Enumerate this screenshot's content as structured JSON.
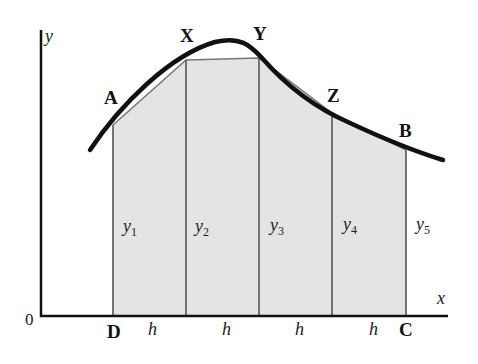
{
  "figure": {
    "type": "trapezium-rule-diagram",
    "colors": {
      "shade": "#e4e4e4",
      "curve": "#111111",
      "axis": "#111111",
      "ordinate": "#555555"
    }
  },
  "axes": {
    "x_label": "x",
    "y_label": "y",
    "origin_label": "0"
  },
  "points": {
    "A": "A",
    "X": "X",
    "Y": "Y",
    "Z": "Z",
    "B": "B",
    "D": "D",
    "C": "C"
  },
  "ordinates": [
    {
      "name": "y",
      "sub": "1"
    },
    {
      "name": "y",
      "sub": "2"
    },
    {
      "name": "y",
      "sub": "3"
    },
    {
      "name": "y",
      "sub": "4"
    },
    {
      "name": "y",
      "sub": "5"
    }
  ],
  "strip_widths": [
    "h",
    "h",
    "h",
    "h"
  ]
}
